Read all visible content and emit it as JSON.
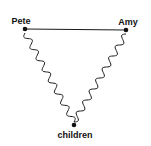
{
  "diagram": {
    "type": "relationship-triangle",
    "nodes": [
      {
        "id": "pete",
        "label": "Pete",
        "x": 25,
        "y": 29
      },
      {
        "id": "amy",
        "label": "Amy",
        "x": 126,
        "y": 30
      },
      {
        "id": "children",
        "label": "children",
        "x": 74,
        "y": 125
      }
    ],
    "edges": [
      {
        "from": "pete",
        "to": "amy",
        "style": "straight"
      },
      {
        "from": "pete",
        "to": "children",
        "style": "wavy"
      },
      {
        "from": "amy",
        "to": "children",
        "style": "wavy"
      }
    ],
    "colors": {
      "line": "#1a1a1a",
      "background": "#ffffff"
    }
  }
}
